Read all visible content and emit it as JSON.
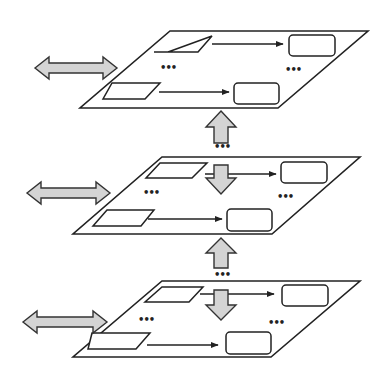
{
  "diagram": {
    "colors": {
      "line": "#222222",
      "arrow_fill": "#d4d4d4",
      "background": "#ffffff"
    },
    "ellipsis": "•••",
    "layers": [
      {
        "id": "layer-top",
        "plane": [
          [
            170,
            31
          ],
          [
            368,
            31
          ],
          [
            278,
            108
          ],
          [
            80,
            108
          ]
        ],
        "inputs": [
          [
            [
              168,
              52
            ],
            [
              212,
              36
            ],
            [
              198,
              52
            ],
            [
              154,
              52
            ]
          ],
          [
            [
              112,
              83
            ],
            [
              160,
              83
            ],
            [
              145,
              99
            ],
            [
              103,
              99
            ]
          ]
        ],
        "outputs": [
          {
            "x": 289,
            "y": 35,
            "w": 46,
            "h": 21
          },
          {
            "x": 234,
            "y": 83,
            "w": 45,
            "h": 21
          }
        ],
        "flows": [
          [
            212,
            44,
            283,
            44
          ],
          [
            159,
            92,
            229,
            92
          ]
        ],
        "dots_left": [
          160,
          71
        ],
        "dots_right": [
          285,
          73
        ],
        "side_arrow": {
          "x1": 35,
          "x2": 117,
          "cy": 68
        }
      },
      {
        "id": "layer-middle",
        "plane": [
          [
            162,
            157
          ],
          [
            360,
            157
          ],
          [
            272,
            234
          ],
          [
            73,
            234
          ]
        ],
        "inputs": [
          [
            [
              160,
              163
            ],
            [
              207,
              163
            ],
            [
              192,
              178
            ],
            [
              146,
              178
            ]
          ],
          [
            [
              107,
              210
            ],
            [
              154,
              210
            ],
            [
              141,
              226
            ],
            [
              93,
              226
            ]
          ]
        ],
        "outputs": [
          {
            "x": 281,
            "y": 162,
            "w": 46,
            "h": 21
          },
          {
            "x": 227,
            "y": 209,
            "w": 45,
            "h": 22
          }
        ],
        "flows": [
          [
            205,
            174,
            276,
            174
          ],
          [
            148,
            219,
            222,
            219
          ]
        ],
        "dots_left": [
          143,
          196
        ],
        "dots_right": [
          277,
          200
        ],
        "side_arrow": {
          "x1": 27,
          "x2": 110,
          "cy": 193
        }
      },
      {
        "id": "layer-bottom",
        "plane": [
          [
            162,
            281
          ],
          [
            360,
            281
          ],
          [
            271,
            357
          ],
          [
            73,
            357
          ]
        ],
        "inputs": [
          [
            [
              162,
              287
            ],
            [
              203,
              287
            ],
            [
              189,
              302
            ],
            [
              145,
              302
            ]
          ],
          [
            [
              92,
              333
            ],
            [
              150,
              333
            ],
            [
              136,
              349
            ],
            [
              88,
              349
            ]
          ]
        ],
        "outputs": [
          {
            "x": 282,
            "y": 285,
            "w": 46,
            "h": 21
          },
          {
            "x": 226,
            "y": 332,
            "w": 45,
            "h": 22
          }
        ],
        "flows": [
          [
            200,
            294,
            274,
            294
          ],
          [
            147,
            345,
            218,
            345
          ]
        ],
        "dots_left": [
          138,
          323
        ],
        "dots_right": [
          268,
          326
        ],
        "side_arrow": {
          "x1": 23,
          "x2": 107,
          "cy": 322
        }
      }
    ],
    "vertical_up_arrows": [
      {
        "cx": 221,
        "tip": 111,
        "head_bottom": 127,
        "shaft_bottom": 143,
        "dots_y": 150
      },
      {
        "cx": 221,
        "tip": 238,
        "head_bottom": 253,
        "shaft_bottom": 268,
        "dots_y": 278
      }
    ],
    "vertical_down_arrows": [
      {
        "cx": 221,
        "shaft_top": 165,
        "head_top": 178,
        "tip": 194
      },
      {
        "cx": 221,
        "shaft_top": 290,
        "head_top": 305,
        "tip": 320
      }
    ]
  }
}
